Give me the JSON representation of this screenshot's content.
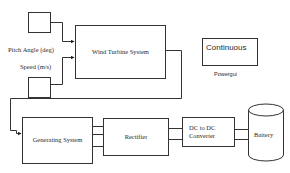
{
  "diagram": {
    "type": "block-diagram",
    "inputs": [
      {
        "id": "pitch",
        "label": "Pitch Angle (deg)"
      },
      {
        "id": "speed",
        "label": "Speed (m/s)"
      }
    ],
    "blocks": {
      "wind_turbine": "Wind Turbine System",
      "continuous": "Continuous",
      "powergui": "Powergui",
      "generating": "Generating System",
      "rectifier": "Rectifier",
      "dc_converter_line1": "DC to DC",
      "dc_converter_line2": "Converter",
      "battery": "Battery"
    },
    "connections": [
      {
        "from": "Pitch Angle (deg)",
        "to": "Wind Turbine System"
      },
      {
        "from": "Speed (m/s)",
        "to": "Wind Turbine System"
      },
      {
        "from": "Wind Turbine System",
        "to": "Generating System"
      },
      {
        "from": "Generating System",
        "to": "Rectifier",
        "lines": 3
      },
      {
        "from": "Rectifier",
        "to": "DC to DC Converter",
        "lines": 2
      },
      {
        "from": "DC to DC Converter",
        "to": "Battery",
        "lines": 2
      }
    ]
  }
}
